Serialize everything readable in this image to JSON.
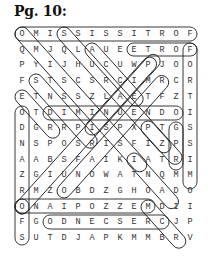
{
  "page": {
    "title": "Pg. 10:"
  },
  "puzzle": {
    "rows": [
      "OMISSISSITROF",
      "QMJQLAUEETROF",
      "PYIJHUCUWPJOO",
      "FSTSCSRCIMRCR",
      "ETNSSZLAETFZT",
      "OTDIMINUENDOI",
      "DGRRPISPXPTGS",
      "NSPOSRISFIZPS",
      "AABSFAIKIATRI",
      "ZGIUNOWATNQMM",
      "RMZOBDZGHOADO",
      "ONAIPOZZEMDII",
      "FGODNECSERCJP",
      "SUTDJAPKMMBRV"
    ],
    "found_words": [
      {
        "word": "FORTISSIMO",
        "start": [
          0,
          12
        ],
        "end": [
          0,
          0
        ]
      },
      {
        "word": "FORTE",
        "start": [
          1,
          12
        ],
        "end": [
          1,
          8
        ]
      },
      {
        "word": "FORTISSIMO",
        "start": [
          1,
          12
        ],
        "end": [
          10,
          12
        ]
      },
      {
        "word": "DIMINUENDO",
        "start": [
          5,
          2
        ],
        "end": [
          5,
          11
        ]
      },
      {
        "word": "CRESCENDO",
        "start": [
          12,
          10
        ],
        "end": [
          12,
          2
        ]
      },
      {
        "word": "DIMEZZOPIANO",
        "start": [
          11,
          10
        ],
        "end": [
          11,
          0
        ]
      }
    ]
  }
}
